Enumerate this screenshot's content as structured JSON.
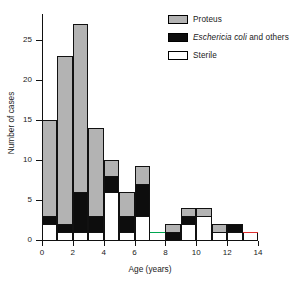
{
  "chart_data": {
    "type": "bar",
    "title": "",
    "subtitle": "",
    "xlabel": "Age (years)",
    "ylabel": "Number of cases",
    "xlim": [
      0,
      14
    ],
    "ylim": [
      0,
      28
    ],
    "xticks": [
      0,
      2,
      4,
      6,
      8,
      10,
      12,
      14
    ],
    "yticks": [
      0,
      5,
      10,
      15,
      20,
      25
    ],
    "grid": false,
    "legend_position": "top-right",
    "stacked": true,
    "bin_width": 1,
    "bin_starts": [
      0,
      1,
      2,
      3,
      4,
      5,
      6,
      7,
      8,
      9,
      10,
      11,
      12,
      13
    ],
    "categories": [
      "0-1",
      "1-2",
      "2-3",
      "3-4",
      "4-5",
      "5-6",
      "6-7",
      "7-8",
      "8-9",
      "9-10",
      "10-11",
      "11-12",
      "12-13",
      "13-14"
    ],
    "series": [
      {
        "name": "Sterile",
        "color": "#ffffff",
        "values": [
          2,
          1,
          1,
          1,
          6,
          1,
          3,
          0,
          0,
          2,
          3,
          1,
          1,
          1
        ]
      },
      {
        "name": "Eschericia coli and others",
        "color": "#0d0d0d",
        "values": [
          1,
          1,
          5,
          2,
          2,
          2,
          4,
          0,
          1,
          1,
          0,
          0,
          1,
          0
        ]
      },
      {
        "name": "Proteus",
        "color": "#b3b3b3",
        "values": [
          12,
          21,
          21,
          11,
          2,
          3,
          2.3,
          0,
          1,
          1,
          1,
          1,
          0,
          0
        ]
      }
    ],
    "totals": [
      15,
      23,
      27,
      14,
      10,
      6,
      9.3,
      0,
      2,
      4,
      4,
      2,
      2,
      1
    ],
    "annotations": [
      {
        "name": "green-marker-line",
        "color": "#00a650",
        "x_start": 7,
        "x_end": 8,
        "y": 1
      },
      {
        "name": "red-marker-line",
        "color": "#e03030",
        "x_start": 13,
        "x_end": 14,
        "y": 1
      }
    ]
  },
  "legend": {
    "items": [
      {
        "label": "Proteus",
        "swatch": "legend-swatch-proteus",
        "italic_part": "",
        "plain_part": "Proteus"
      },
      {
        "label": "Eschericia coli and others",
        "swatch": "legend-swatch-ecoli",
        "italic_part": "Eschericia coli",
        "plain_part": " and others"
      },
      {
        "label": "Sterile",
        "swatch": "legend-swatch-sterile",
        "italic_part": "",
        "plain_part": "Sterile"
      }
    ]
  },
  "axes": {
    "x_title": "Age (years)",
    "y_title": "Number of cases",
    "x_tick_labels": [
      "0",
      "2",
      "4",
      "6",
      "8",
      "10",
      "12",
      "14"
    ],
    "y_tick_labels": [
      "0",
      "5",
      "10",
      "15",
      "20",
      "25"
    ]
  },
  "colors": {
    "proteus": "#b3b3b3",
    "ecoli": "#0d0d0d",
    "sterile": "#ffffff",
    "axis": "#111111",
    "green_marker": "#00a650",
    "red_marker": "#e03030"
  }
}
